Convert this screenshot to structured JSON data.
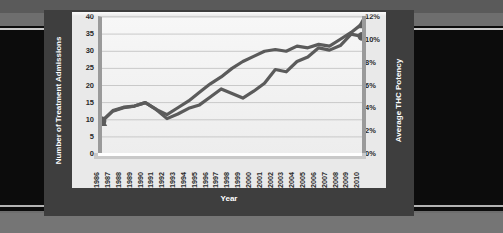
{
  "chart_data": {
    "type": "line",
    "title": "",
    "xlabel": "Year",
    "ylabel": "Number of Treatment Admissions",
    "y2label": "Average THC Potency",
    "grid": true,
    "legend_position": "none",
    "ylim": [
      0,
      40
    ],
    "y2lim": [
      0,
      12
    ],
    "yticks": [
      "40",
      "35",
      "30",
      "25",
      "20",
      "15",
      "10",
      "5",
      "0"
    ],
    "y2ticks": [
      "12%",
      "10%",
      "8%",
      "6%",
      "4%",
      "2%",
      "0%"
    ],
    "categories": [
      "1986",
      "1987",
      "1988",
      "1989",
      "1990",
      "1991",
      "1992",
      "1993",
      "1994",
      "1995",
      "1996",
      "1997",
      "1998",
      "1999",
      "2000",
      "2001",
      "2002",
      "2003",
      "2004",
      "2005",
      "2006",
      "2007",
      "2008",
      "2009",
      "2010"
    ],
    "series": [
      {
        "name": "Number of Treatment Admissions",
        "axis": "left",
        "marker": "triangle",
        "color": "#5b5b5b",
        "values": [
          9.5,
          12.5,
          13.5,
          14.0,
          15.0,
          13.0,
          11.5,
          13.5,
          15.5,
          18.0,
          20.5,
          22.5,
          25.0,
          27.0,
          28.5,
          30.0,
          30.5,
          30.0,
          31.5,
          31.0,
          32.0,
          31.5,
          33.5,
          35.5,
          38.0
        ],
        "start_marker_value": 9.5,
        "end_marker_value": 38.0
      },
      {
        "name": "Average THC Potency",
        "axis": "right",
        "marker": "circle",
        "color": "#5b5b5b",
        "values": [
          2.9,
          3.8,
          4.1,
          4.2,
          4.5,
          3.9,
          3.1,
          3.5,
          4.0,
          4.3,
          5.0,
          5.7,
          5.3,
          4.9,
          5.5,
          6.2,
          7.4,
          7.2,
          8.1,
          8.5,
          9.3,
          9.1,
          9.5,
          10.5,
          10.3
        ],
        "start_marker_value": 2.9,
        "end_marker_value": 10.3
      }
    ]
  }
}
